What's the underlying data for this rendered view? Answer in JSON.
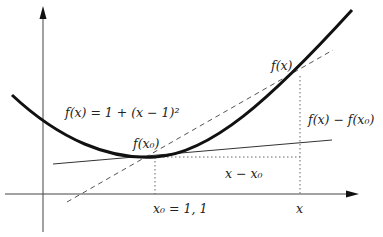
{
  "diagram": {
    "labels": {
      "function": "f(x) = 1 + (x − 1)²",
      "f_x0": "f(x₀)",
      "f_x": "f(x)",
      "difference": "f(x) − f(x₀)",
      "dx": "x − x₀",
      "x0_tick": "x₀ = 1, 1",
      "x_tick": "x"
    },
    "colors": {
      "curve": "#111111",
      "axes": "#444444",
      "guides": "#666666"
    }
  }
}
